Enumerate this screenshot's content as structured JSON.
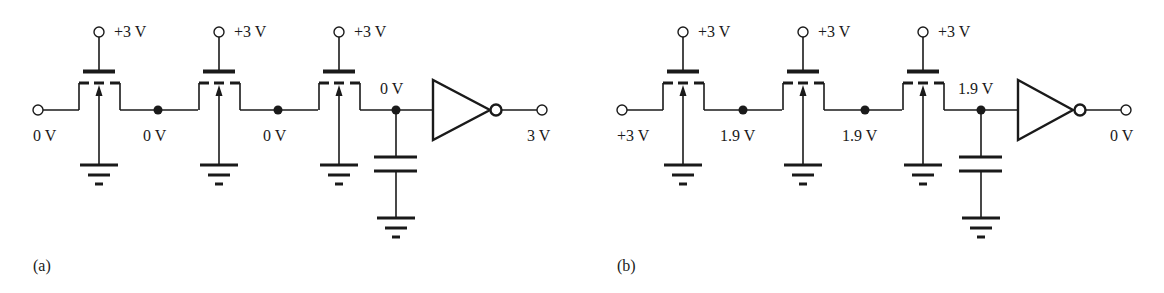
{
  "figure": {
    "panels": [
      {
        "id": "a",
        "caption": "(a)",
        "input_label": "0 V",
        "gate_labels": [
          "+3 V",
          "+3 V",
          "+3 V"
        ],
        "node_labels": [
          "0 V",
          "0 V"
        ],
        "last_node_label": "0 V",
        "output_label": "3 V"
      },
      {
        "id": "b",
        "caption": "(b)",
        "input_label": "+3 V",
        "gate_labels": [
          "+3 V",
          "+3 V",
          "+3 V"
        ],
        "node_labels": [
          "1.9 V",
          "1.9 V"
        ],
        "last_node_label": "1.9 V",
        "output_label": "0 V"
      }
    ],
    "components": {
      "transistor": "nmos-pass-transistor (depletion style, dashed channel, body arrow to ground)",
      "load": "capacitor to ground",
      "output_stage": "inverter"
    },
    "colors": {
      "ink": "#1a1a1a",
      "background": "#ffffff"
    }
  }
}
